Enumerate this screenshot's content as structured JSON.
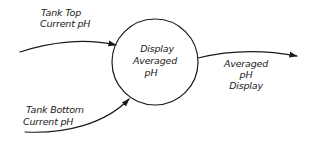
{
  "diagram": {
    "type": "data-flow-diagram",
    "process": {
      "lines": [
        "Display",
        "Averaged",
        "pH"
      ]
    },
    "flows": [
      {
        "id": "tank-top",
        "direction": "in",
        "lines": [
          "Tank Top",
          "Current pH"
        ]
      },
      {
        "id": "tank-bottom",
        "direction": "in",
        "lines": [
          "Tank Bottom",
          "Current pH"
        ]
      },
      {
        "id": "averaged-display",
        "direction": "out",
        "lines": [
          "Averaged",
          "pH",
          "Display"
        ]
      }
    ]
  }
}
